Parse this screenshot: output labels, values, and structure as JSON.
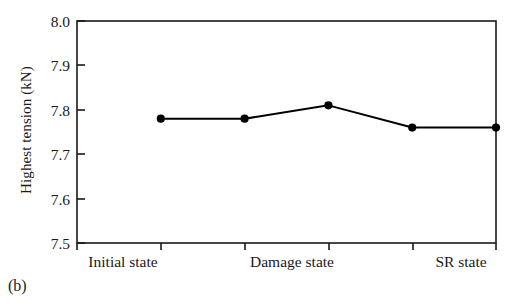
{
  "caption": "(b)",
  "chart_data": {
    "type": "line",
    "title": "",
    "subtitle": "",
    "xlabel": "",
    "ylabel": "Highest tension (kN)",
    "categories": [
      "Initial state",
      "",
      "Damage state",
      "",
      "SR state"
    ],
    "x_tick_labels": [
      "Initial state",
      "Damage state",
      "SR state"
    ],
    "x_tick_label_positions": [
      1,
      3,
      5
    ],
    "values": [
      7.78,
      7.78,
      7.81,
      7.76,
      7.76
    ],
    "series": [
      {
        "name": "Highest tension",
        "values": [
          7.78,
          7.78,
          7.81,
          7.76,
          7.76
        ],
        "color": "#000000",
        "marker": "filled-circle",
        "line_style": "solid"
      }
    ],
    "ylim": [
      7.5,
      8.0
    ],
    "y_ticks": [
      7.5,
      7.6,
      7.7,
      7.8,
      7.9,
      8.0
    ],
    "y_tick_labels": [
      "7.5",
      "7.6",
      "7.7",
      "7.8",
      "7.9",
      "8.0"
    ],
    "n_x_ticks": 6,
    "grid": false,
    "legend": false,
    "legend_position": "none",
    "frame": true,
    "colors": {
      "line": "#000000",
      "marker": "#000000",
      "axis": "#1a1a1a",
      "background": "#ffffff",
      "text": "#1a1a1a"
    }
  }
}
